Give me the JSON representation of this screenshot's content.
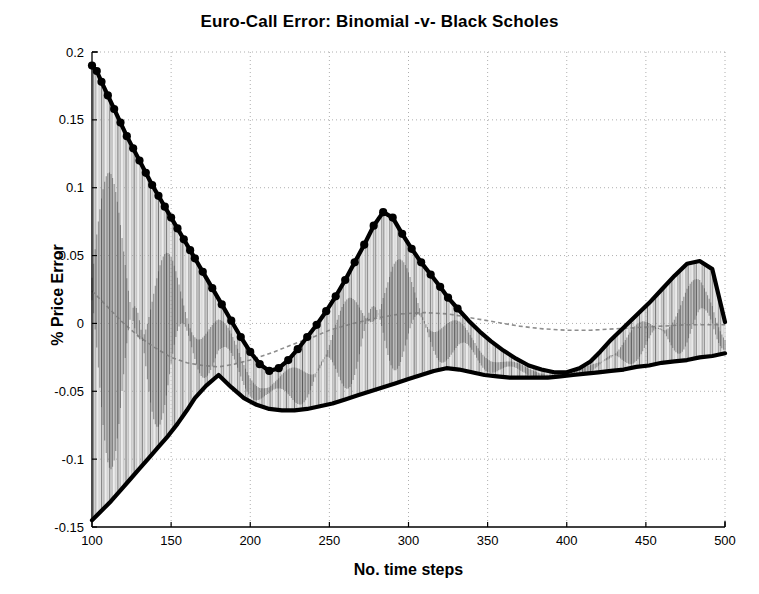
{
  "chart_data": {
    "type": "line",
    "title": "Euro-Call Error:  Binomial -v- Black Scholes",
    "xlabel": "No. time steps",
    "ylabel": "% Price Error",
    "xlim": [
      100,
      500
    ],
    "ylim": [
      -0.15,
      0.2
    ],
    "xticks": [
      100,
      150,
      200,
      250,
      300,
      350,
      400,
      450,
      500
    ],
    "yticks": [
      -0.15,
      -0.1,
      -0.05,
      0,
      0.05,
      0.1,
      0.15,
      0.2
    ],
    "xticklabels": [
      "100",
      "150",
      "200",
      "250",
      "300",
      "350",
      "400",
      "450",
      "500"
    ],
    "yticklabels": [
      "-0.15",
      "-0.1",
      "-0.05",
      "0",
      "0.05",
      "0.1",
      "0.15",
      "0.2"
    ],
    "grid": true,
    "grid_style": "dotted",
    "legend": null,
    "series": [
      {
        "name": "upper envelope",
        "style": "thick-black-line-with-dot-markers",
        "color": "#000000",
        "x": [
          100,
          103,
          106,
          110,
          114,
          118,
          122,
          126,
          130,
          134,
          138,
          142,
          146,
          150,
          154,
          158,
          162,
          165,
          170,
          176,
          182,
          188,
          194,
          200,
          206,
          212,
          218,
          224,
          230,
          236,
          242,
          248,
          254,
          260,
          266,
          272,
          278,
          284,
          290,
          296,
          302,
          308,
          314,
          320,
          325,
          331,
          338,
          345,
          352,
          360,
          368,
          376,
          384,
          392,
          400,
          408,
          415,
          421,
          428,
          436,
          444,
          452,
          460,
          468,
          476,
          484,
          492,
          500
        ],
        "y": [
          0.19,
          0.186,
          0.178,
          0.168,
          0.158,
          0.148,
          0.138,
          0.129,
          0.12,
          0.111,
          0.102,
          0.094,
          0.086,
          0.078,
          0.07,
          0.062,
          0.054,
          0.048,
          0.038,
          0.026,
          0.014,
          0.002,
          -0.01,
          -0.021,
          -0.03,
          -0.035,
          -0.033,
          -0.027,
          -0.019,
          -0.01,
          -0.001,
          0.009,
          0.02,
          0.032,
          0.045,
          0.058,
          0.072,
          0.082,
          0.078,
          0.066,
          0.055,
          0.045,
          0.036,
          0.027,
          0.019,
          0.011,
          0.002,
          -0.006,
          -0.013,
          -0.02,
          -0.026,
          -0.031,
          -0.034,
          -0.036,
          -0.036,
          -0.033,
          -0.028,
          -0.021,
          -0.012,
          -0.003,
          0.006,
          0.015,
          0.025,
          0.035,
          0.044,
          0.046,
          0.04,
          0.001
        ]
      },
      {
        "name": "lower envelope",
        "style": "thick-black-line",
        "color": "#000000",
        "x": [
          100,
          106,
          112,
          118,
          124,
          130,
          136,
          142,
          148,
          154,
          160,
          165,
          172,
          180,
          188,
          196,
          204,
          212,
          220,
          228,
          236,
          244,
          252,
          260,
          268,
          276,
          284,
          292,
          300,
          308,
          316,
          324,
          332,
          340,
          348,
          356,
          364,
          372,
          380,
          388,
          396,
          404,
          412,
          420,
          428,
          436,
          444,
          452,
          460,
          468,
          476,
          484,
          492,
          500
        ],
        "y": [
          -0.145,
          -0.138,
          -0.131,
          -0.123,
          -0.115,
          -0.107,
          -0.099,
          -0.091,
          -0.083,
          -0.074,
          -0.064,
          -0.055,
          -0.046,
          -0.038,
          -0.047,
          -0.055,
          -0.06,
          -0.063,
          -0.064,
          -0.064,
          -0.063,
          -0.061,
          -0.059,
          -0.056,
          -0.053,
          -0.05,
          -0.047,
          -0.044,
          -0.041,
          -0.038,
          -0.035,
          -0.033,
          -0.034,
          -0.036,
          -0.038,
          -0.039,
          -0.04,
          -0.04,
          -0.04,
          -0.04,
          -0.039,
          -0.038,
          -0.037,
          -0.036,
          -0.035,
          -0.034,
          -0.032,
          -0.031,
          -0.029,
          -0.028,
          -0.027,
          -0.025,
          -0.024,
          -0.022
        ]
      },
      {
        "name": "interior oscillation band",
        "style": "dense-vertical-stems-gray",
        "color": "#555555",
        "description": "dense vertical lines spanning between lower and upper envelope for every integer time step"
      },
      {
        "name": "mean trace",
        "style": "faint-gray-curve",
        "color": "#7a7a7a",
        "x": [
          100,
          110,
          120,
          130,
          140,
          150,
          160,
          170,
          180,
          190,
          200,
          215,
          230,
          240,
          250,
          265,
          280,
          295,
          310,
          325,
          340,
          355,
          370,
          385,
          400,
          415,
          430,
          445,
          460,
          475,
          490,
          500
        ],
        "y": [
          0.024,
          0.012,
          0.0,
          -0.01,
          -0.018,
          -0.025,
          -0.029,
          -0.031,
          -0.032,
          -0.03,
          -0.027,
          -0.021,
          -0.014,
          -0.01,
          -0.005,
          0.0,
          0.004,
          0.007,
          0.008,
          0.007,
          0.004,
          0.001,
          -0.002,
          -0.004,
          -0.005,
          -0.005,
          -0.004,
          -0.003,
          -0.002,
          -0.001,
          -0.001,
          -0.001
        ]
      }
    ],
    "notes": [
      "Upper envelope carries round black dot markers in the region n=100 to n=330",
      "Envelopes cross near n=165 (y=-0.035) and near n=325 (y=-0.033)",
      "Upper envelope local maxima: 0.082 at n=236, 0.046 at n=421",
      "Lower envelope local minimum: -0.064 at n=224"
    ]
  },
  "axes": {
    "plot_left_px": 92,
    "plot_right_px": 725,
    "plot_top_px": 52,
    "plot_bottom_px": 527
  }
}
